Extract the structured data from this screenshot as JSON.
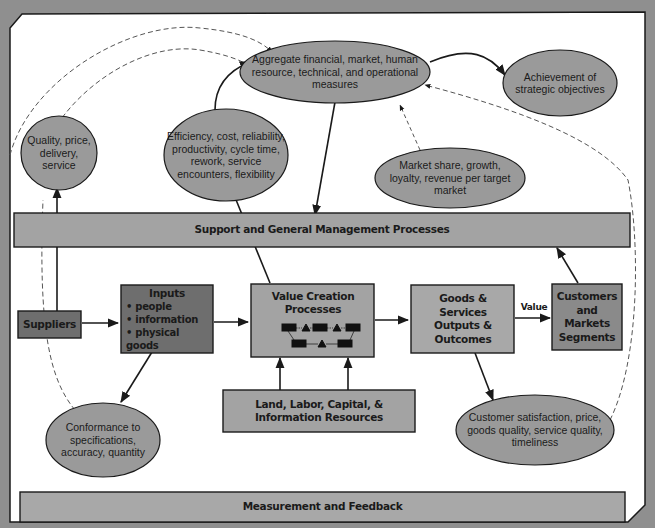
{
  "colors": {
    "background": "#8f8f8f",
    "panel": "#ffffff",
    "ellipse_fill": "#9a9a9a",
    "box_light": "#a8a8a8",
    "box_dark": "#6e6e6e",
    "bar_fill": "#a3a3a3",
    "stroke": "#1a1a1a",
    "dashed": "#555555"
  },
  "ellipses": {
    "aggregate": "Aggregate financial, market, human resource, technical, and operational measures",
    "strategic": "Achievement of strategic objectives",
    "quality": "Quality, price, delivery, service",
    "efficiency": "Efficiency, cost, reliability, productivity, cycle time, rework, service encounters, flexibility",
    "market_share": "Market share, growth, loyalty, revenue per target market",
    "conformance": "Conformance to specifications, accuracy, quantity",
    "customer_satisfaction": "Customer satisfaction, price, goods quality, service quality, timeliness"
  },
  "boxes": {
    "support_bar": "Support and General Management Processes",
    "suppliers": "Suppliers",
    "inputs_title": "Inputs",
    "inputs_items": [
      "people",
      "information",
      "physical goods"
    ],
    "value_creation": "Value Creation Processes",
    "goods_services": "Goods & Services Outputs & Outcomes",
    "customers": "Customers and Markets Segments",
    "resources": "Land, Labor, Capital, & Information Resources",
    "measurement_bar": "Measurement and Feedback"
  },
  "arrow_labels": {
    "value": "Value"
  }
}
